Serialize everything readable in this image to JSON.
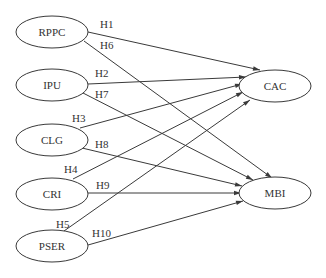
{
  "diagram": {
    "type": "path-model",
    "nodes": [
      {
        "id": "RPPC",
        "label": "RPPC",
        "cx": 52,
        "cy": 32,
        "rx": 36,
        "ry": 16
      },
      {
        "id": "IPU",
        "label": "IPU",
        "cx": 52,
        "cy": 85,
        "rx": 36,
        "ry": 16
      },
      {
        "id": "CLG",
        "label": "CLG",
        "cx": 52,
        "cy": 140,
        "rx": 36,
        "ry": 16
      },
      {
        "id": "CRI",
        "label": "CRI",
        "cx": 52,
        "cy": 194,
        "rx": 36,
        "ry": 16
      },
      {
        "id": "PSER",
        "label": "PSER",
        "cx": 52,
        "cy": 246,
        "rx": 36,
        "ry": 16
      },
      {
        "id": "CAC",
        "label": "CAC",
        "cx": 275,
        "cy": 86,
        "rx": 36,
        "ry": 16
      },
      {
        "id": "MBI",
        "label": "MBI",
        "cx": 275,
        "cy": 193,
        "rx": 36,
        "ry": 16
      }
    ],
    "edges": [
      {
        "label": "H1",
        "from": "RPPC",
        "to": "CAC",
        "x1": 88,
        "y1": 32,
        "x2": 260,
        "y2": 70,
        "lx": 100,
        "ly": 28
      },
      {
        "label": "H6",
        "from": "RPPC",
        "to": "MBI",
        "x1": 84,
        "y1": 41,
        "x2": 272,
        "y2": 178,
        "lx": 100,
        "ly": 49
      },
      {
        "label": "H2",
        "from": "IPU",
        "to": "CAC",
        "x1": 88,
        "y1": 84,
        "x2": 246,
        "y2": 77,
        "lx": 95,
        "ly": 77
      },
      {
        "label": "H7",
        "from": "IPU",
        "to": "MBI",
        "x1": 83,
        "y1": 93,
        "x2": 253,
        "y2": 180,
        "lx": 95,
        "ly": 98
      },
      {
        "label": "H3",
        "from": "CLG",
        "to": "CAC",
        "x1": 80,
        "y1": 128,
        "x2": 242,
        "y2": 84,
        "lx": 72,
        "ly": 122
      },
      {
        "label": "H8",
        "from": "CLG",
        "to": "MBI",
        "x1": 82,
        "y1": 148,
        "x2": 242,
        "y2": 186,
        "lx": 95,
        "ly": 148
      },
      {
        "label": "H4",
        "from": "CRI",
        "to": "CAC",
        "x1": 73,
        "y1": 179,
        "x2": 243,
        "y2": 92,
        "lx": 64,
        "ly": 173
      },
      {
        "label": "H9",
        "from": "CRI",
        "to": "MBI",
        "x1": 88,
        "y1": 193,
        "x2": 241,
        "y2": 193,
        "lx": 96,
        "ly": 189
      },
      {
        "label": "H5",
        "from": "PSER",
        "to": "CAC",
        "x1": 64,
        "y1": 231,
        "x2": 250,
        "y2": 100,
        "lx": 56,
        "ly": 228
      },
      {
        "label": "H10",
        "from": "PSER",
        "to": "MBI",
        "x1": 88,
        "y1": 245,
        "x2": 243,
        "y2": 201,
        "lx": 92,
        "ly": 237
      }
    ],
    "colors": {
      "stroke": "#3a3a3a",
      "text": "#333333",
      "background": "#ffffff"
    }
  }
}
